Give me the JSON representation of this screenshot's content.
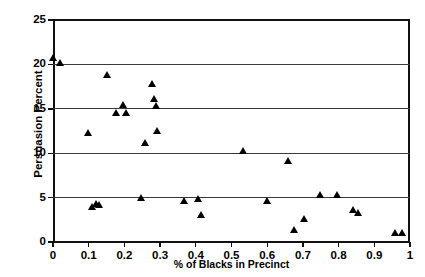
{
  "chart_data": {
    "type": "scatter",
    "title": "",
    "xlabel": "% of Blacks in Precinct",
    "ylabel": "Persuasion Percent",
    "xlim": [
      0,
      1
    ],
    "ylim": [
      0,
      25
    ],
    "xticks": [
      0,
      0.1,
      0.2,
      0.3,
      0.4,
      0.5,
      0.6,
      0.7,
      0.8,
      0.9,
      1
    ],
    "xticklabels": [
      "0",
      "0.1",
      "0.2",
      "0.3",
      "0.4",
      "0.5",
      "0.6",
      "0.7",
      "0.8",
      "0.9",
      "1"
    ],
    "yticks": [
      0,
      5,
      10,
      15,
      20,
      25
    ],
    "yticklabels": [
      "0",
      "5",
      "10",
      "15",
      "20",
      "25"
    ],
    "grid": "horizontal",
    "legend": "none",
    "marker": "triangle-up",
    "marker_color": "#000000",
    "series": [
      {
        "name": "Precincts",
        "points": [
          [
            0.0,
            20.7
          ],
          [
            0.02,
            20.2
          ],
          [
            0.098,
            12.3
          ],
          [
            0.11,
            4.0
          ],
          [
            0.12,
            4.3
          ],
          [
            0.13,
            4.2
          ],
          [
            0.152,
            18.8
          ],
          [
            0.178,
            14.6
          ],
          [
            0.196,
            15.5
          ],
          [
            0.205,
            14.6
          ],
          [
            0.248,
            5.0
          ],
          [
            0.258,
            11.2
          ],
          [
            0.278,
            17.8
          ],
          [
            0.283,
            16.1
          ],
          [
            0.29,
            15.3
          ],
          [
            0.292,
            12.5
          ],
          [
            0.368,
            4.7
          ],
          [
            0.408,
            4.9
          ],
          [
            0.415,
            3.1
          ],
          [
            0.533,
            10.3
          ],
          [
            0.6,
            4.6
          ],
          [
            0.66,
            9.2
          ],
          [
            0.675,
            1.4
          ],
          [
            0.705,
            2.6
          ],
          [
            0.748,
            5.3
          ],
          [
            0.795,
            5.3
          ],
          [
            0.84,
            3.6
          ],
          [
            0.855,
            3.3
          ],
          [
            0.958,
            1.0
          ],
          [
            0.978,
            1.1
          ]
        ]
      }
    ]
  }
}
